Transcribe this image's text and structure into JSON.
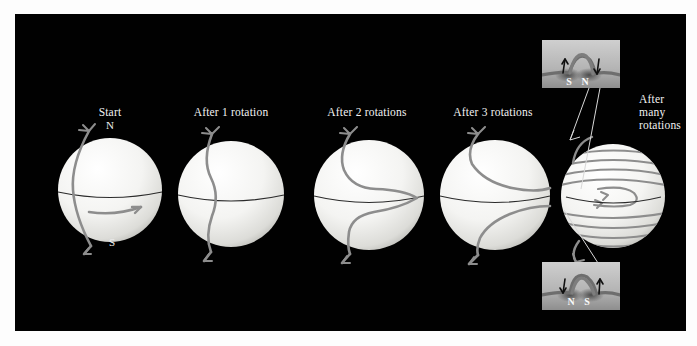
{
  "figure": {
    "background_color": "#010101",
    "page_background": "#fdfdfd",
    "text_color": "#f2f2f2",
    "fieldline_color": "#8d8d8d",
    "sphere_color": "#f2f2f0"
  },
  "panels": [
    {
      "id": "start",
      "label": "Start",
      "pole_north": "N",
      "pole_south": "S",
      "cx": 95,
      "cy": 176,
      "r": 52,
      "label_x": 95,
      "label_y": 98,
      "windings": 0
    },
    {
      "id": "rot1",
      "label": "After 1 rotation",
      "cx": 216,
      "cy": 180,
      "r": 53,
      "label_x": 216,
      "label_y": 98,
      "windings": 1
    },
    {
      "id": "rot2",
      "label": "After 2 rotations",
      "cx": 352,
      "cy": 180,
      "r": 55,
      "label_x": 352,
      "label_y": 98,
      "windings": 2
    },
    {
      "id": "rot3",
      "label": "After 3 rotations",
      "cx": 478,
      "cy": 180,
      "r": 55,
      "label_x": 478,
      "label_y": 98,
      "windings": 3
    },
    {
      "id": "many",
      "label_lines": [
        "After",
        "many",
        "rotations"
      ],
      "cx": 598,
      "cy": 182,
      "r": 52,
      "label_x": 628,
      "label_y": 80,
      "windings": 12
    }
  ],
  "insets": [
    {
      "id": "inset-top",
      "x": 542,
      "y": 40,
      "w": 78,
      "h": 48,
      "polarity_left": "S",
      "polarity_right": "N",
      "arrow_left": "up",
      "arrow_right": "down",
      "caption": "emerging magnetic loop, northern hemisphere"
    },
    {
      "id": "inset-bottom",
      "x": 542,
      "y": 262,
      "w": 78,
      "h": 48,
      "polarity_left": "N",
      "polarity_right": "S",
      "arrow_left": "down",
      "arrow_right": "up",
      "caption": "emerging magnetic loop, southern hemisphere"
    }
  ],
  "rotation_arrow": {
    "name": "equatorial-rotation-arrow",
    "direction": "eastward"
  }
}
